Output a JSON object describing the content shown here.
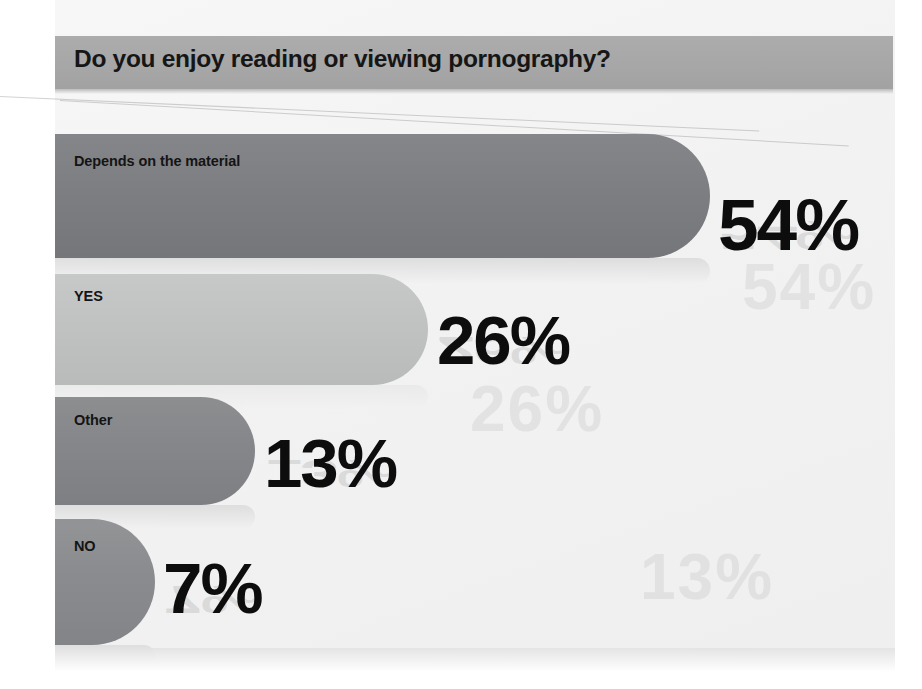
{
  "chart_data": {
    "type": "bar",
    "title": "Do you enjoy reading or viewing pornography?",
    "orientation": "horizontal",
    "categories": [
      "Depends on the material",
      "YES",
      "Other",
      "NO"
    ],
    "values": [
      54,
      26,
      13,
      7
    ],
    "value_labels": [
      "54%",
      "26%",
      "13%",
      "7%"
    ],
    "unit": "%",
    "xlabel": "",
    "ylabel": "",
    "xlim": [
      0,
      100
    ],
    "grid": false,
    "legend": null,
    "series": [
      {
        "name": "Share of respondents",
        "values": [
          54,
          26,
          13,
          7
        ]
      }
    ],
    "bar_colors": [
      "#7e7f83",
      "#c1c2c2",
      "#86878a",
      "#8b8c8f"
    ]
  },
  "title_band": {
    "text": "Do you enjoy reading or viewing pornography?",
    "background": "#a6a7a6",
    "text_color": "#161616"
  },
  "bars": [
    {
      "label": "Depends on the material",
      "value_label": "54%",
      "value": 54,
      "color": "#7e7f83"
    },
    {
      "label": "YES",
      "value_label": "26%",
      "value": 26,
      "color": "#c1c2c2"
    },
    {
      "label": "Other",
      "value_label": "13%",
      "value": 13,
      "color": "#86878a"
    },
    {
      "label": "NO",
      "value_label": "7%",
      "value": 7,
      "color": "#8b8c8f"
    }
  ],
  "artifacts": {
    "ghost_a": "54%",
    "ghost_b": "26%",
    "ghost_c": "13%"
  },
  "colors": {
    "page_background": "#f2f2f2",
    "value_text": "#0d0d0d",
    "label_text": "#141414"
  }
}
